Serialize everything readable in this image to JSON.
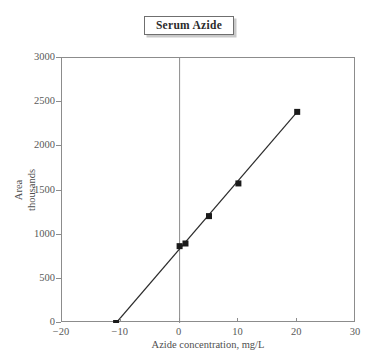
{
  "chart_data": {
    "type": "scatter",
    "title": "Serum Azide",
    "xlabel": "Azide concentration, mg/L",
    "ylabel_lines": [
      "Area",
      "thousands"
    ],
    "ylabel": "Area thousands",
    "xlim": [
      -20,
      30
    ],
    "ylim": [
      0,
      3000
    ],
    "xticks": [
      -20,
      -10,
      0,
      10,
      20,
      30
    ],
    "xtick_labels": [
      "−20",
      "−10",
      "0",
      "10",
      "20",
      "30"
    ],
    "yticks": [
      0,
      500,
      1000,
      1500,
      2000,
      2500,
      3000
    ],
    "ytick_labels": [
      "0",
      "500",
      "1000",
      "1500",
      "2000",
      "2500",
      "3000"
    ],
    "grid": false,
    "legend": false,
    "marker": "filled-square",
    "marker_color": "#1a1a1a",
    "line_color": "#2b2b2b",
    "frame_color": "#8c8c8c",
    "vertical_axis_at_x": 0,
    "x": [
      -10.8,
      0,
      1,
      5,
      10,
      20
    ],
    "y": [
      0,
      870,
      900,
      1210,
      1580,
      2390
    ],
    "points": [
      {
        "x": -10.8,
        "y": 0
      },
      {
        "x": 0,
        "y": 870
      },
      {
        "x": 1,
        "y": 900
      },
      {
        "x": 5,
        "y": 1210
      },
      {
        "x": 10,
        "y": 1580
      },
      {
        "x": 20,
        "y": 2390
      }
    ],
    "series": [
      {
        "name": "Serum Azide calibration",
        "x": [
          -10.8,
          0,
          1,
          5,
          10,
          20
        ],
        "values": [
          0,
          870,
          900,
          1210,
          1580,
          2390
        ]
      }
    ],
    "fit_line": {
      "from": {
        "x": -10.8,
        "y": 0
      },
      "to": {
        "x": 20,
        "y": 2390
      }
    }
  }
}
